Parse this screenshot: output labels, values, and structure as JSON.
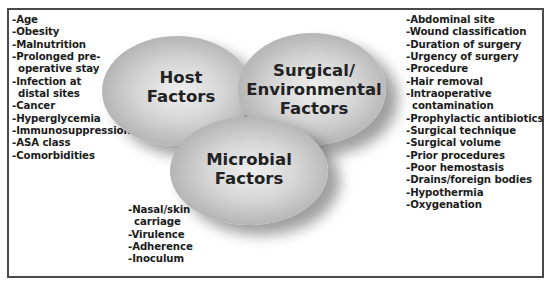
{
  "diagram": {
    "title": "",
    "circles": {
      "host": {
        "label_line1": "Host",
        "label_line2": "Factors"
      },
      "surgical": {
        "label_line1": "Surgical/",
        "label_line2": "Environmental",
        "label_line3": "Factors"
      },
      "microbial": {
        "label_line1": "Microbial",
        "label_line2": "Factors"
      }
    },
    "host_factors": [
      "-Age",
      "-Obesity",
      "-Malnutrition",
      "-Prolonged pre-",
      "operative stay",
      "-Infection at",
      "distal sites",
      "-Cancer",
      "-Hyperglycemia",
      "-Immunosuppression",
      "-ASA class",
      "-Comorbidities"
    ],
    "surgical_factors": [
      "-Abdominal site",
      "-Wound classification",
      "-Duration of surgery",
      "-Urgency of surgery",
      "-Procedure",
      "-Hair removal",
      "-Intraoperative",
      "contamination",
      "-Prophylactic antibiotics",
      "-Surgical technique",
      "-Surgical volume",
      "-Prior procedures",
      "-Poor hemostasis",
      "-Drains/foreign bodies",
      "-Hypothermia",
      "-Oxygenation"
    ],
    "microbial_factors": [
      "-Nasal/skin",
      "carriage",
      "-Virulence",
      "-Adherence",
      "-Inoculum"
    ],
    "colors": {
      "border": "#4a4a4a",
      "ellipse_light": "#efefef",
      "ellipse_dark": "#979797",
      "text": "#1c1c1c"
    }
  }
}
